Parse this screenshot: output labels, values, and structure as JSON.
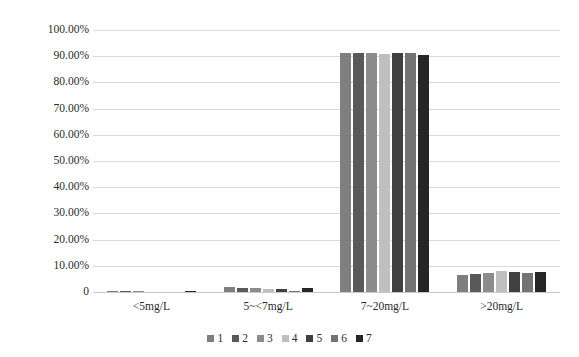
{
  "chart_data": {
    "type": "bar",
    "title": "",
    "subtitle": "",
    "xlabel": "",
    "ylabel": "",
    "grid": true,
    "legend_position": "bottom",
    "ylim": [
      0,
      100
    ],
    "ytick_labels": [
      "100.00%",
      "90.00%",
      "80.00%",
      "70.00%",
      "60.00%",
      "50.00%",
      "40.00%",
      "30.00%",
      "20.00%",
      "10.00%",
      "0"
    ],
    "ytick_values": [
      100,
      90,
      80,
      70,
      60,
      50,
      40,
      30,
      20,
      10,
      0
    ],
    "categories": [
      "<5mg/L",
      "5~<7mg/L",
      "7~20mg/L",
      ">20mg/L"
    ],
    "series": [
      {
        "name": "1",
        "color": "#7f7f7f",
        "values": [
          0.3,
          1.9,
          91.2,
          6.6
        ]
      },
      {
        "name": "2",
        "color": "#595959",
        "values": [
          0.2,
          1.6,
          91.3,
          7.0
        ]
      },
      {
        "name": "3",
        "color": "#8c8c8c",
        "values": [
          0.2,
          1.4,
          91.2,
          7.2
        ]
      },
      {
        "name": "4",
        "color": "#bfbfbf",
        "values": [
          0.1,
          1.2,
          90.7,
          7.9
        ]
      },
      {
        "name": "5",
        "color": "#404040",
        "values": [
          0.1,
          1.0,
          91.4,
          7.5
        ]
      },
      {
        "name": "6",
        "color": "#737373",
        "values": [
          0.0,
          0.4,
          91.3,
          7.3
        ]
      },
      {
        "name": "7",
        "color": "#262626",
        "values": [
          0.2,
          1.5,
          90.6,
          7.7
        ]
      }
    ]
  },
  "legend": {
    "items": [
      {
        "label": "1"
      },
      {
        "label": "2"
      },
      {
        "label": "3"
      },
      {
        "label": "4"
      },
      {
        "label": "5"
      },
      {
        "label": "6"
      },
      {
        "label": "7"
      }
    ]
  }
}
